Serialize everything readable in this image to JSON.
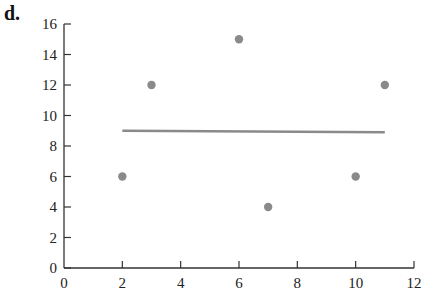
{
  "panel_label": "d.",
  "chart_data": {
    "type": "scatter",
    "title": "",
    "xlabel": "",
    "ylabel": "",
    "xlim": [
      0,
      12
    ],
    "ylim": [
      0,
      16
    ],
    "xticks": [
      0,
      2,
      4,
      6,
      8,
      10,
      12
    ],
    "yticks": [
      0,
      2,
      4,
      6,
      8,
      10,
      12,
      14,
      16
    ],
    "grid": false,
    "legend": null,
    "series": [
      {
        "name": "points",
        "type": "scatter",
        "x": [
          2,
          3,
          6,
          7,
          10,
          11
        ],
        "y": [
          6,
          12,
          15,
          4,
          6,
          12
        ],
        "color": "#8a8a8a"
      },
      {
        "name": "fit line",
        "type": "line",
        "x": [
          2,
          11
        ],
        "y": [
          9.0,
          8.9
        ],
        "color": "#8a8a8a"
      }
    ]
  }
}
